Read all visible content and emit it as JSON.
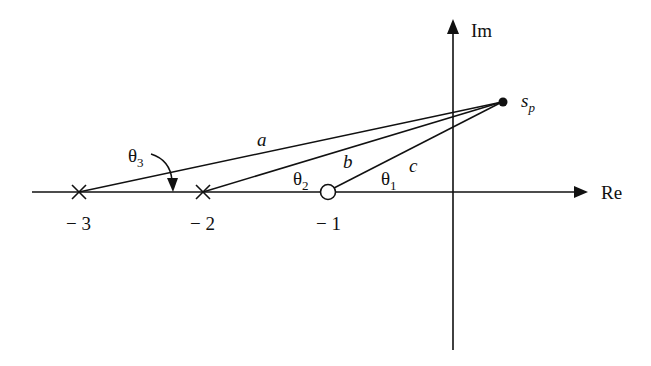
{
  "diagram": {
    "type": "s-plane pole-zero plot",
    "axes": {
      "real_label": "Re",
      "imag_label": "Im"
    },
    "tick_labels": [
      "− 3",
      "− 2",
      "− 1"
    ],
    "poles": [
      {
        "name": "pole-minus-3",
        "value": -3,
        "marker": "x"
      },
      {
        "name": "pole-minus-2",
        "value": -2,
        "marker": "x"
      }
    ],
    "zeros": [
      {
        "name": "zero-minus-1",
        "value": -1,
        "marker": "o"
      }
    ],
    "test_point": {
      "label_main": "s",
      "label_sub": "p"
    },
    "vectors": [
      {
        "from": -3,
        "label": "a"
      },
      {
        "from": -2,
        "label": "b"
      },
      {
        "from": -1,
        "label": "c"
      }
    ],
    "angles": [
      {
        "main": "θ",
        "sub": "3"
      },
      {
        "main": "θ",
        "sub": "2"
      },
      {
        "main": "θ",
        "sub": "1"
      }
    ],
    "colors": {
      "ink": "#111111",
      "background": "#ffffff"
    }
  }
}
